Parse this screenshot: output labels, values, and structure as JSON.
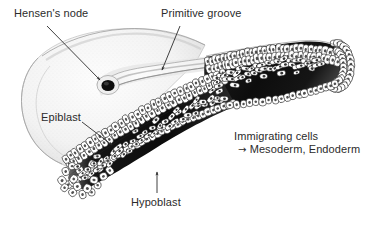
{
  "figure": {
    "background_color": "#ffffff",
    "ink_color": "#2b2b2b"
  },
  "labels": {
    "hensens_node": "Hensen's node",
    "primitive_groove": "Primitive groove",
    "epiblast": "Epiblast",
    "hypoblast": "Hypoblast",
    "immigrating_cells": "Immigrating cells",
    "fates_arrow": "→",
    "fates": "Mesoderm, Endoderm"
  },
  "leader_lines": {
    "hensens_node": "diagonal line from label down-right to node pit, arrowhead",
    "primitive_groove": "diagonal line from label down-right to groove, arrowhead",
    "epiblast": "diagonal line from label down-right to upper epithelium, arrowhead",
    "hypoblast": "vertical line from label up to lower cell layer, arrowhead"
  },
  "structures": {
    "epiblast_dome": {
      "name": "epiblast surface dome",
      "fill": "#f4f4f4",
      "stroke": "#b9b9b9",
      "description": "smooth stippled intact blastoderm surface, left portion"
    },
    "primitive_groove": {
      "name": "primitive groove",
      "fill": "#fafafa",
      "description": "elongate pale tubular depression running to upper right"
    },
    "hensens_node_pit": {
      "name": "Hensen's node pit",
      "fill": "#111111",
      "description": "dark rounded pit at anterior end of the groove"
    },
    "cut_face": {
      "name": "cut face of the primitive streak",
      "cavity_fill": "#121212",
      "cell_fill": "#ffffff",
      "cell_stroke": "#1d1d1d",
      "description": "wedge-shaped sectioned slab with upper columnar epiblast, dark middle space containing loose migrating cells, and lower single-layered hypoblast"
    },
    "migrating_cells": {
      "name": "immigrating mesenchymal cells",
      "fill": "#ffffff",
      "nucleus_fill": "#333333",
      "description": "spindle-shaped pale cells scattered within the dark space between germ layers"
    }
  },
  "icons": {
    "arrowhead": "arrowhead-icon",
    "right_arrow": "right-arrow-icon"
  }
}
